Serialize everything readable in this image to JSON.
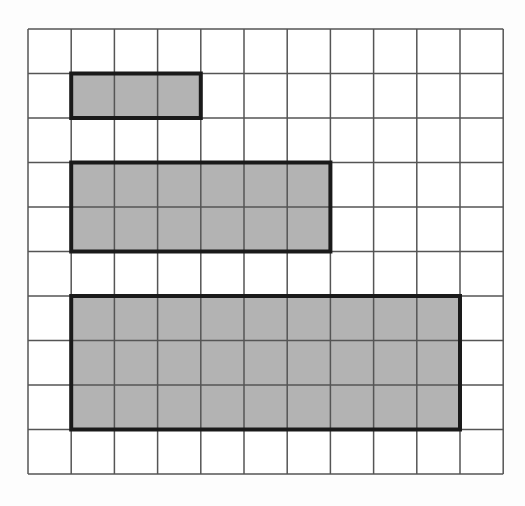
{
  "grid": {
    "cols": 11,
    "rows": 10,
    "x0": 28,
    "y0": 29,
    "cell_w": 43.2,
    "cell_h": 44.5,
    "line_color": "#555555",
    "background": "#ffffff"
  },
  "rectangles": [
    {
      "name": "rect-3x1",
      "col": 1,
      "row": 1,
      "width": 3,
      "height": 1
    },
    {
      "name": "rect-6x2",
      "col": 1,
      "row": 3,
      "width": 6,
      "height": 2
    },
    {
      "name": "rect-9x3",
      "col": 1,
      "row": 6,
      "width": 9,
      "height": 3
    }
  ],
  "colors": {
    "fill": "#b3b3b3",
    "border": "#1a1a1a"
  }
}
